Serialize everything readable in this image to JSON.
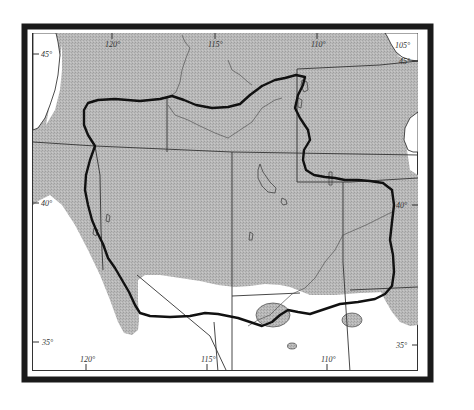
{
  "map": {
    "type": "range map",
    "colors": {
      "shaded_region": "#b4b4b4",
      "unshaded": "#ffffff",
      "frame": "#1a1a1a",
      "boundary_line": "#111111",
      "state_lines": "#333333",
      "rivers": "#444444"
    },
    "longitude_labels_top": [
      "120°",
      "115°",
      "110°",
      "105°"
    ],
    "longitude_labels_bottom": [
      "120°",
      "115°",
      "110°"
    ],
    "latitude_labels_left": [
      "45°",
      "40°",
      "35°"
    ],
    "latitude_labels_right": [
      "45°",
      "40°",
      "35°"
    ],
    "legend": {
      "shaded_area": "Gray stippled range area",
      "heavy_outline": "Heavy black outline boundary"
    }
  }
}
